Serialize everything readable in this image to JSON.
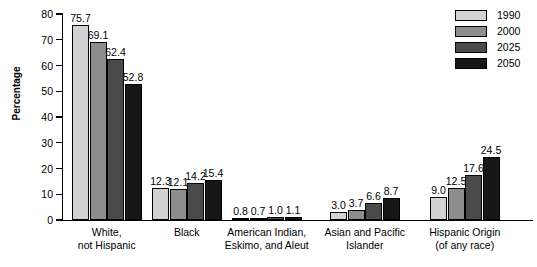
{
  "chart_data": {
    "type": "bar",
    "title": "",
    "xlabel": "",
    "ylabel": "Percentage",
    "ylim": [
      0,
      80
    ],
    "ytick_labels": [
      "0",
      "10",
      "20",
      "30",
      "40",
      "50",
      "60",
      "70",
      "80"
    ],
    "yticks": [
      0,
      10,
      20,
      30,
      40,
      50,
      60,
      70,
      80
    ],
    "grid": false,
    "legend_position": "top-right",
    "categories": [
      "White, not Hispanic",
      "Black",
      "American Indian, Eskimo, and Aleut",
      "Asian and Pacific Islander",
      "Hispanic Origin (of any race)"
    ],
    "category_lines": [
      [
        "White,",
        "not Hispanic"
      ],
      [
        "Black",
        ""
      ],
      [
        "American Indian,",
        "Eskimo, and Aleut"
      ],
      [
        "Asian and Pacific",
        "Islander"
      ],
      [
        "Hispanic Origin",
        "(of any race)"
      ]
    ],
    "series": [
      {
        "name": "1990",
        "color": "#d2d2d2",
        "values": [
          75.7,
          12.3,
          0.8,
          3.0,
          9.0
        ],
        "labels": [
          "75.7",
          "12.3",
          "0.8",
          "3.0",
          "9.0"
        ]
      },
      {
        "name": "2000",
        "color": "#8d8d8d",
        "values": [
          69.1,
          12.1,
          0.7,
          3.7,
          12.5
        ],
        "labels": [
          "69.1",
          "12.1",
          "0.7",
          "3.7",
          "12.5"
        ]
      },
      {
        "name": "2025",
        "color": "#4a4a4a",
        "values": [
          62.4,
          14.2,
          1.0,
          6.6,
          17.6
        ],
        "labels": [
          "62.4",
          "14.2",
          "1.0",
          "6.6",
          "17.6"
        ]
      },
      {
        "name": "2050",
        "color": "#171717",
        "values": [
          52.8,
          15.4,
          1.1,
          8.7,
          24.5
        ],
        "labels": [
          "52.8",
          "15.4",
          "1.1",
          "8.7",
          "24.5"
        ]
      }
    ]
  },
  "legend": {
    "items": [
      {
        "label": "1990",
        "color": "#d2d2d2"
      },
      {
        "label": "2000",
        "color": "#8d8d8d"
      },
      {
        "label": "2025",
        "color": "#4a4a4a"
      },
      {
        "label": "2050",
        "color": "#171717"
      }
    ]
  }
}
